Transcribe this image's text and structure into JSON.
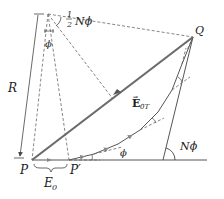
{
  "diagram": {
    "type": "phasor-diagram",
    "labels": {
      "R": "R",
      "half_N_phi_num": "1",
      "half_N_phi_den": "2",
      "half_N_phi_rest": "Nϕ",
      "phi_top": "ϕ",
      "Q": "Q",
      "E0T_main": "E",
      "E0T_sub": "0T",
      "E0T_arrow": "→",
      "P": "P",
      "P_prime": "P′",
      "E0": "E",
      "E0_sub": "0",
      "phi_bottom": "ϕ",
      "N_phi": "Nϕ"
    },
    "colors": {
      "line": "#555555",
      "resultant": "#6b6b6b",
      "dashed": "#666666",
      "text": "#222222"
    }
  }
}
